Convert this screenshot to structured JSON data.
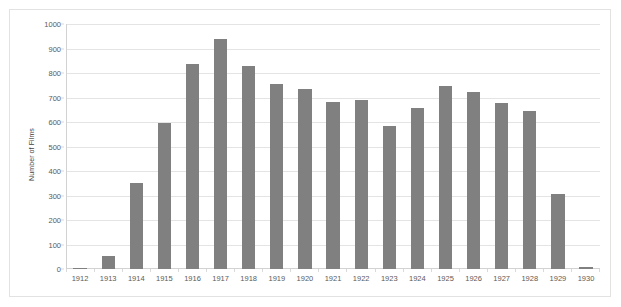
{
  "chart_data": {
    "type": "bar",
    "title": "",
    "xlabel": "",
    "ylabel": "Number of Films",
    "ylim": [
      0,
      1000
    ],
    "ytick_labels": [
      "1000",
      "900",
      "800",
      "700",
      "600",
      "500",
      "400",
      "300",
      "200",
      "100",
      "0"
    ],
    "ytick_values": [
      1000,
      900,
      800,
      700,
      600,
      500,
      400,
      300,
      200,
      100,
      0
    ],
    "grid": true,
    "legend": false,
    "bar_color": "#808080",
    "gridline_color": "#e4e4e4",
    "categories": [
      "1912",
      "1913",
      "1914",
      "1915",
      "1916",
      "1917",
      "1918",
      "1919",
      "1920",
      "1921",
      "1922",
      "1923",
      "1924",
      "1925",
      "1926",
      "1927",
      "1928",
      "1929",
      "1930"
    ],
    "values": [
      6,
      55,
      350,
      598,
      838,
      937,
      830,
      757,
      733,
      683,
      690,
      583,
      659,
      745,
      722,
      678,
      645,
      307,
      8
    ]
  }
}
